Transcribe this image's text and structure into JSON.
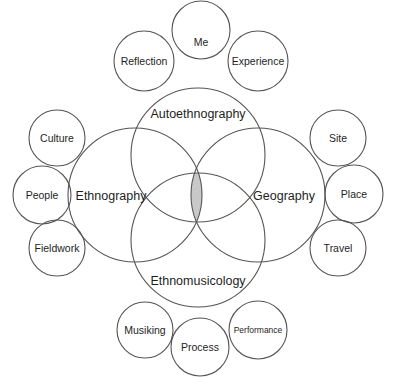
{
  "diagram": {
    "type": "venn",
    "main_circles": [
      {
        "label": "Autoethnography",
        "cx": 198,
        "cy": 155,
        "r": 67
      },
      {
        "label": "Ethnography",
        "cx": 135,
        "cy": 195,
        "r": 67
      },
      {
        "label": "Geography",
        "cx": 258,
        "cy": 195,
        "r": 67
      },
      {
        "label": "Ethnomusicology",
        "cx": 198,
        "cy": 240,
        "r": 67
      }
    ],
    "intersection_fill": "#c8c8c8",
    "satellite_circles": [
      {
        "label": "Me",
        "parent": "Autoethnography",
        "cx": 201,
        "cy": 30,
        "r": 29
      },
      {
        "label": "Reflection",
        "parent": "Autoethnography",
        "cx": 144,
        "cy": 61,
        "r": 30
      },
      {
        "label": "Experience",
        "parent": "Autoethnography",
        "cx": 258,
        "cy": 61,
        "r": 30
      },
      {
        "label": "Culture",
        "parent": "Ethnography",
        "cx": 57,
        "cy": 138,
        "r": 28
      },
      {
        "label": "People",
        "parent": "Ethnography",
        "cx": 42,
        "cy": 195,
        "r": 29
      },
      {
        "label": "Fieldwork",
        "parent": "Ethnography",
        "cx": 57,
        "cy": 248,
        "r": 28
      },
      {
        "label": "Site",
        "parent": "Geography",
        "cx": 338,
        "cy": 138,
        "r": 28
      },
      {
        "label": "Place",
        "parent": "Geography",
        "cx": 354,
        "cy": 194,
        "r": 29
      },
      {
        "label": "Travel",
        "parent": "Geography",
        "cx": 338,
        "cy": 248,
        "r": 28
      },
      {
        "label": "Musiking",
        "parent": "Ethnomusicology",
        "cx": 145,
        "cy": 330,
        "r": 28
      },
      {
        "label": "Process",
        "parent": "Ethnomusicology",
        "cx": 200,
        "cy": 347,
        "r": 29
      },
      {
        "label": "Performance",
        "parent": "Ethnomusicology",
        "cx": 258,
        "cy": 330,
        "r": 29
      }
    ]
  },
  "labels": {
    "autoethnography": "Autoethnography",
    "ethnography": "Ethnography",
    "geography": "Geography",
    "ethnomusicology": "Ethnomusicology",
    "me": "Me",
    "reflection": "Reflection",
    "experience": "Experience",
    "culture": "Culture",
    "people": "People",
    "fieldwork": "Fieldwork",
    "site": "Site",
    "place": "Place",
    "travel": "Travel",
    "musiking": "Musiking",
    "process": "Process",
    "performance": "Performance"
  }
}
